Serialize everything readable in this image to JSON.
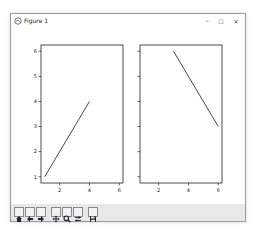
{
  "window": {
    "title": "Figure 1",
    "controls": {
      "minimize": "–",
      "maximize": "☐",
      "close": "✕"
    }
  },
  "toolbar": {
    "buttons": [
      {
        "name": "home",
        "icon": "home-icon"
      },
      {
        "name": "back",
        "icon": "arrow-left-icon"
      },
      {
        "name": "forward",
        "icon": "arrow-right-icon"
      },
      {
        "name": "pan",
        "icon": "move-icon"
      },
      {
        "name": "zoom",
        "icon": "magnifier-icon"
      },
      {
        "name": "configure-subplots",
        "icon": "sliders-icon"
      },
      {
        "name": "save",
        "icon": "floppy-disk-icon"
      }
    ]
  },
  "chart_data": [
    {
      "type": "line",
      "title": "",
      "xlabel": "",
      "ylabel": "",
      "xlim": [
        0.75,
        6.25
      ],
      "ylim": [
        0.75,
        6.25
      ],
      "xticks": [
        2,
        4,
        6
      ],
      "yticks": [
        1,
        2,
        3,
        4,
        5,
        6
      ],
      "ytick_labels_visible": true,
      "series": [
        {
          "name": "line",
          "x": [
            1,
            4
          ],
          "y": [
            1,
            4
          ],
          "color": "#333333"
        }
      ]
    },
    {
      "type": "line",
      "title": "",
      "xlabel": "",
      "ylabel": "",
      "xlim": [
        0.75,
        6.25
      ],
      "ylim": [
        0.75,
        6.25
      ],
      "xticks": [
        2,
        4,
        6
      ],
      "yticks": [
        1,
        2,
        3,
        4,
        5,
        6
      ],
      "ytick_labels_visible": false,
      "series": [
        {
          "name": "line",
          "x": [
            3,
            6
          ],
          "y": [
            6,
            3
          ],
          "color": "#333333"
        }
      ]
    }
  ]
}
